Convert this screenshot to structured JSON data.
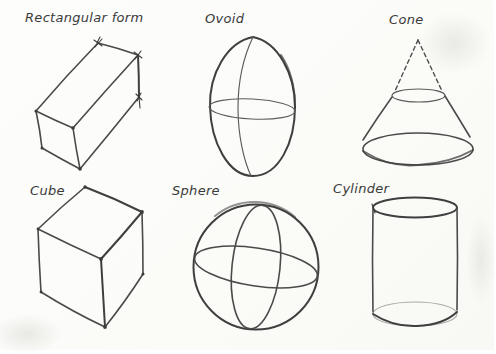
{
  "colors": {
    "ink": "#4a4a4a",
    "paper": "#fcfcfa",
    "label_text": "#3a3a3a"
  },
  "figures": [
    {
      "label": "Rectangular form",
      "drawing": "rectangular-box-sketch"
    },
    {
      "label": "Ovoid",
      "drawing": "ovoid-egg-sketch"
    },
    {
      "label": "Cone",
      "drawing": "truncated-cone-with-dashed-apex-sketch"
    },
    {
      "label": "Cube",
      "drawing": "cube-sketch"
    },
    {
      "label": "Sphere",
      "drawing": "sphere-with-equator-and-meridian-sketch"
    },
    {
      "label": "Cylinder",
      "drawing": "cylinder-sketch"
    }
  ]
}
